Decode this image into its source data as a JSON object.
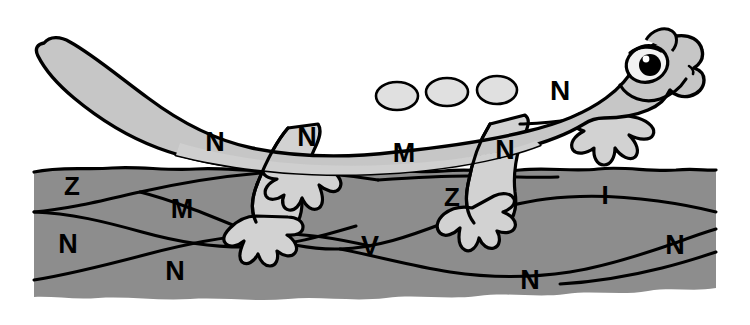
{
  "canvas": {
    "width": 750,
    "height": 325,
    "background": "#ffffff"
  },
  "scene": {
    "title": "Salamander on ground",
    "subject": "salamander",
    "description": "Cartoon gray salamander with light spots standing on a gray patch of ground, overlaid with scattered capital letters."
  },
  "colors": {
    "background": "#ffffff",
    "outline": "#000000",
    "body_fill": "#c6c6c6",
    "belly_fill": "#cfcfcf",
    "limb_fill": "#d2d2d2",
    "spot_fill": "#e0e0e0",
    "ground_fill": "#8d8d8d",
    "ground_shade": "#848484",
    "eye_white": "#f2f2f2",
    "eye_pupil": "#000000",
    "letter_color": "#000000"
  },
  "animal": {
    "name": "salamander",
    "parts": [
      {
        "name": "tail",
        "label": "tail"
      },
      {
        "name": "body",
        "label": "body"
      },
      {
        "name": "belly",
        "label": "belly"
      },
      {
        "name": "head",
        "label": "head"
      },
      {
        "name": "eye",
        "label": "eye"
      },
      {
        "name": "mouth",
        "label": "mouth"
      },
      {
        "name": "nostril",
        "label": "nostril"
      },
      {
        "name": "front-leg",
        "label": "front leg"
      },
      {
        "name": "hind-leg",
        "label": "hind leg"
      }
    ],
    "spot_count": 3,
    "spots": [
      {
        "cx": 397,
        "cy": 96,
        "rx": 21,
        "ry": 14
      },
      {
        "cx": 447,
        "cy": 92,
        "rx": 21,
        "ry": 14
      },
      {
        "cx": 497,
        "cy": 90,
        "rx": 20,
        "ry": 14
      }
    ]
  },
  "letters": [
    {
      "id": "letter-n-tail",
      "char": "N",
      "x": 215,
      "y": 144,
      "size": 27,
      "layer": "animal",
      "part": "tail"
    },
    {
      "id": "letter-n-hind-leg",
      "char": "N",
      "x": 307,
      "y": 139,
      "size": 27,
      "layer": "animal",
      "part": "hind-leg"
    },
    {
      "id": "letter-m-belly",
      "char": "M",
      "x": 404,
      "y": 155,
      "size": 27,
      "layer": "animal",
      "part": "belly"
    },
    {
      "id": "letter-n-front-leg",
      "char": "N",
      "x": 505,
      "y": 152,
      "size": 27,
      "layer": "animal",
      "part": "front-leg"
    },
    {
      "id": "letter-n-back",
      "char": "N",
      "x": 560,
      "y": 93,
      "size": 28,
      "layer": "animal",
      "part": "body"
    },
    {
      "id": "letter-z-ground-left",
      "char": "Z",
      "x": 72,
      "y": 188,
      "size": 26,
      "layer": "ground",
      "part": "ground"
    },
    {
      "id": "letter-m-ground",
      "char": "M",
      "x": 182,
      "y": 211,
      "size": 27,
      "layer": "ground",
      "part": "ground"
    },
    {
      "id": "letter-n-ground-left",
      "char": "N",
      "x": 68,
      "y": 246,
      "size": 27,
      "layer": "ground",
      "part": "ground"
    },
    {
      "id": "letter-n-ground-low",
      "char": "N",
      "x": 175,
      "y": 273,
      "size": 27,
      "layer": "ground",
      "part": "ground"
    },
    {
      "id": "letter-v-ground",
      "char": "V",
      "x": 370,
      "y": 248,
      "size": 27,
      "layer": "ground",
      "part": "ground"
    },
    {
      "id": "letter-z-ground-mid",
      "char": "Z",
      "x": 452,
      "y": 199,
      "size": 26,
      "layer": "ground",
      "part": "ground"
    },
    {
      "id": "letter-i-ground",
      "char": "I",
      "x": 605,
      "y": 197,
      "size": 26,
      "layer": "ground",
      "part": "ground"
    },
    {
      "id": "letter-n-ground-ctr",
      "char": "N",
      "x": 530,
      "y": 282,
      "size": 27,
      "layer": "ground",
      "part": "ground"
    },
    {
      "id": "letter-n-ground-right",
      "char": "N",
      "x": 675,
      "y": 247,
      "size": 27,
      "layer": "ground",
      "part": "ground"
    }
  ],
  "letters_summary": {
    "total": 14,
    "on_animal": 5,
    "on_ground": 9,
    "unique": [
      "N",
      "M",
      "Z",
      "V",
      "I"
    ],
    "sequence": "N N M N N Z M N N V Z I N N"
  }
}
